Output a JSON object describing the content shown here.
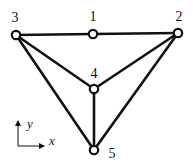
{
  "diagram": {
    "type": "truss",
    "colors": {
      "line": "#111111",
      "node_fill": "#ffffff",
      "background": "#ffffff"
    },
    "nodes": [
      {
        "id": "1",
        "label": "1",
        "x": 93,
        "y": 34,
        "label_x": 93,
        "label_y": 21
      },
      {
        "id": "2",
        "label": "2",
        "x": 178,
        "y": 33,
        "label_x": 179,
        "label_y": 21
      },
      {
        "id": "3",
        "label": "3",
        "x": 16,
        "y": 35,
        "label_x": 15,
        "label_y": 22
      },
      {
        "id": "4",
        "label": "4",
        "x": 94,
        "y": 89,
        "label_x": 94,
        "label_y": 78
      },
      {
        "id": "5",
        "label": "5",
        "x": 94,
        "y": 150,
        "label_x": 112,
        "label_y": 158
      }
    ],
    "edges": [
      {
        "from": "3",
        "to": "1"
      },
      {
        "from": "1",
        "to": "2"
      },
      {
        "from": "3",
        "to": "4"
      },
      {
        "from": "2",
        "to": "4"
      },
      {
        "from": "4",
        "to": "5"
      },
      {
        "from": "3",
        "to": "5"
      },
      {
        "from": "2",
        "to": "5"
      }
    ],
    "axes": {
      "origin": {
        "x": 18,
        "y": 146
      },
      "x_end": {
        "x": 44,
        "y": 146
      },
      "y_end": {
        "x": 18,
        "y": 121
      },
      "x_label": "x",
      "y_label": "y",
      "x_label_pos": {
        "x": 49,
        "y": 145
      },
      "y_label_pos": {
        "x": 27,
        "y": 128
      }
    }
  }
}
